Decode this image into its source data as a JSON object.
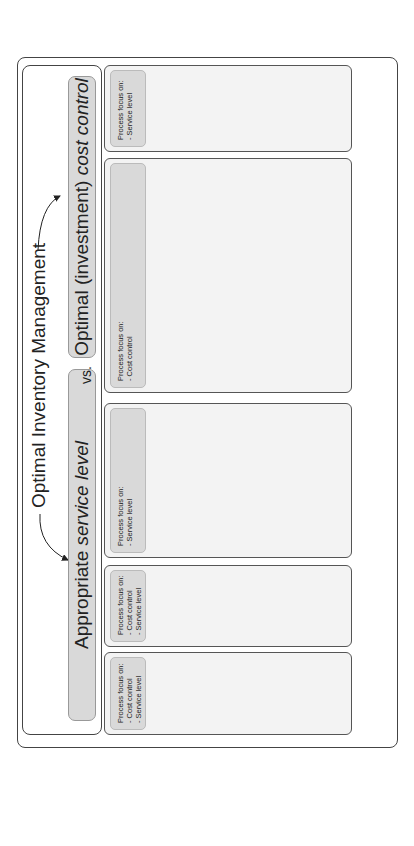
{
  "header": {
    "title": "Optimal Inventory Management",
    "left_banner_prefix": "Appropriate ",
    "left_banner_emph": "service level",
    "vs_label": "vs.",
    "right_banner_prefix": "Optimal (investment) ",
    "right_banner_emph": "cost control"
  },
  "inputs": {
    "start_oval": [
      "MRP-parameters",
      "+ Orders"
    ],
    "end_oval": "Distribute"
  },
  "kpis_label": "KPIs",
  "sections": [
    {
      "name": "Forecasting",
      "focus_title": "Process focus on:",
      "focus_items": [
        "- Cost control",
        "- Service level"
      ],
      "kpis": [
        "Forecasting accuracy",
        "Forecasting interval"
      ],
      "processes": [
        "Forecasting / Planning"
      ]
    },
    {
      "name": "Purchase",
      "focus_title": "Process focus on:",
      "focus_items": [
        "- Cost control",
        "- Service level"
      ],
      "kpis": [
        "Order lead time",
        "Order cycle time",
        "Frequency of delivery",
        "Number of supplier-contracts",
        "Budget overruns"
      ],
      "processes": [
        "Purchase"
      ]
    },
    {
      "name": "Goods receipt",
      "focus_title": "Process focus on:",
      "focus_items": [
        "- Service level"
      ],
      "kpis": [
        "Supplier on time deliveries",
        "Supplier too late deliveries",
        "Verification mismatches"
      ],
      "kpis_2": [
        "Quality rejections",
        "Incomplete order rejections",
        "Return orders",
        "Approved orders"
      ],
      "processes": [
        "Goods receipt",
        "Quality Check"
      ],
      "side_process": "Quarantine"
    },
    {
      "name": "Storage",
      "focus_title": "Process focus on:",
      "focus_items": [
        "- Cost control"
      ],
      "kpis": [
        "Total stock value",
        "Average inventory",
        "Inventory turnover",
        "Number of days inventory",
        "Stockouts",
        "Safety stock usage",
        "Overstocking",
        "Scap percentage"
      ],
      "processes": [
        "Record",
        "Stock",
        "Move"
      ]
    },
    {
      "name": "Goods issue",
      "focus_title": "Process focus on:",
      "focus_items": [
        "- Service level"
      ],
      "kpis": [
        "Order issue time",
        "Goods issued on time",
        "Goods issued too late",
        "Order fill rate",
        "Rush orders"
      ],
      "processes": [
        "Goods Issue"
      ]
    }
  ],
  "general_kpis": {
    "title": "General KPIs",
    "groups": [
      [
        "Total trade value",
        "Inventory value"
      ],
      [
        "Labour",
        "Labour Percentage"
      ],
      [
        "Number of different items in stock",
        "Number of storage locations"
      ]
    ]
  },
  "colors": {
    "process_box": "#8c8c8c",
    "banner": "#d9d9d9",
    "oval": "#111111",
    "section_bg": "#f3f3f3"
  }
}
